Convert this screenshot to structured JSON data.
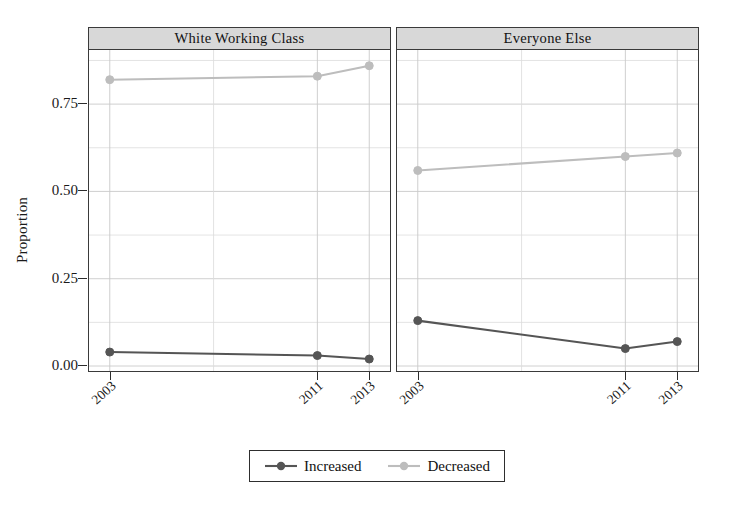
{
  "chart_data": {
    "type": "line",
    "title": "",
    "xlabel": "",
    "ylabel": "Proportion",
    "x": [
      2003,
      2011,
      2013
    ],
    "xticklabels": [
      "2003",
      "2011",
      "2013"
    ],
    "yticklabels": [
      "0.00",
      "0.25",
      "0.50",
      "0.75"
    ],
    "yticks": [
      0.0,
      0.25,
      0.5,
      0.75
    ],
    "ylim": [
      -0.02,
      0.905
    ],
    "xlim": [
      2002.2,
      2013.8
    ],
    "grid": true,
    "grid_minor": true,
    "legend_position": "bottom",
    "panels": [
      {
        "label": "White Working Class",
        "series": [
          {
            "name": "Increased",
            "color": "#555555",
            "values": [
              0.04,
              0.03,
              0.02
            ]
          },
          {
            "name": "Decreased",
            "color": "#bdbdbd",
            "values": [
              0.82,
              0.83,
              0.86
            ]
          }
        ]
      },
      {
        "label": "Everyone Else",
        "series": [
          {
            "name": "Increased",
            "color": "#555555",
            "values": [
              0.13,
              0.05,
              0.07
            ]
          },
          {
            "name": "Decreased",
            "color": "#bdbdbd",
            "values": [
              0.56,
              0.6,
              0.61
            ]
          }
        ]
      }
    ],
    "legend": [
      {
        "label": "Increased",
        "color": "#555555"
      },
      {
        "label": "Decreased",
        "color": "#bdbdbd"
      }
    ]
  },
  "colors": {
    "increased": "#555555",
    "decreased": "#bdbdbd",
    "strip_background": "#d8d8d8",
    "panel_border": "#3a3a3a",
    "grid": "#c9c9c9",
    "background": "#ffffff"
  }
}
